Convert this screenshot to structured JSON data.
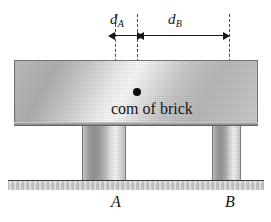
{
  "figure": {
    "dimensions": {
      "da": {
        "symbol": "d",
        "subscript": "A"
      },
      "db": {
        "symbol": "d",
        "subscript": "B"
      }
    },
    "com": {
      "caption": "com of brick",
      "dot": "center-of-mass-dot"
    },
    "supports": {
      "a_label": "A",
      "b_label": "B"
    },
    "colors": {
      "brick_mid": "#cfcfcf",
      "brick_highlight": "#fbfbfb",
      "outline": "#6f6f6f",
      "ground": "#cacaca",
      "ink": "#151515"
    }
  }
}
